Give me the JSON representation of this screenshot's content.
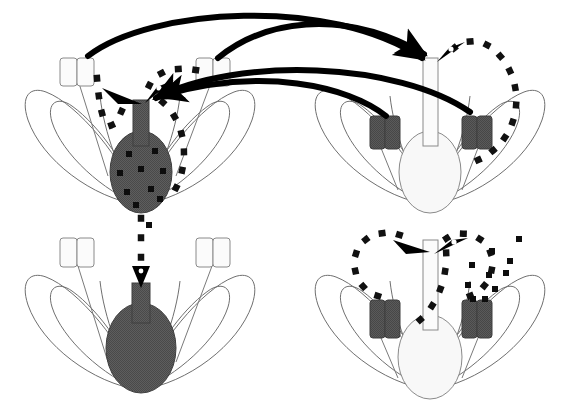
{
  "figure": {
    "width": 571,
    "height": 408,
    "background": "#ffffff",
    "panel_count": 4
  },
  "palette": {
    "outline": "#6b6b6b",
    "dark_fill": "#595959",
    "dark_fill_edge": "#3d3d3d",
    "light_fill": "#f7f7f7",
    "light_fill_edge": "#8a8a8a",
    "pollen_dot": "#111111",
    "arrow_solid": "#000000",
    "background": "#ffffff"
  },
  "legend_semantics": {
    "solid_thick_arrow": "cross-pollination pollen transfer between flowers",
    "dotted_arc_arrow": "self-pollination pollen transfer within a flower",
    "dark_organ": "dark (shaded) pistil or anther morph",
    "light_organ": "light (unshaded) pistil or anther morph"
  },
  "panels": [
    {
      "id": "top-left",
      "position": "top-left",
      "morph": "dark-pistil",
      "pistil": {
        "style_fill": "dark",
        "ovary_fill": "dark",
        "ovule_dots": 9
      },
      "anthers": [
        {
          "side": "left",
          "fill": "light"
        },
        {
          "side": "right",
          "fill": "light"
        }
      ],
      "petals": 2,
      "receives_cross_pollen": true,
      "self_pollination_arcs": 2
    },
    {
      "id": "top-right",
      "position": "top-right",
      "morph": "light-pistil",
      "pistil": {
        "style_fill": "light",
        "ovary_fill": "light",
        "ovule_dots": 0
      },
      "anthers": [
        {
          "side": "left",
          "fill": "dark"
        },
        {
          "side": "right",
          "fill": "dark"
        }
      ],
      "petals": 2,
      "receives_cross_pollen": true,
      "self_pollination_arcs": 1
    },
    {
      "id": "bottom-left",
      "position": "bottom-left",
      "morph": "dark-pistil",
      "pistil": {
        "style_fill": "dark",
        "ovary_fill": "dark",
        "ovule_dots": 0
      },
      "anthers": [
        {
          "side": "left",
          "fill": "light"
        },
        {
          "side": "right",
          "fill": "light"
        }
      ],
      "petals": 2,
      "receives_cross_pollen": false,
      "self_pollination_arcs": 0
    },
    {
      "id": "bottom-right",
      "position": "bottom-right",
      "morph": "light-pistil",
      "pistil": {
        "style_fill": "light",
        "ovary_fill": "light",
        "ovule_dots": 0
      },
      "anthers": [
        {
          "side": "left",
          "fill": "dark"
        },
        {
          "side": "right",
          "fill": "dark"
        }
      ],
      "petals": 2,
      "receives_cross_pollen": false,
      "self_pollination_arcs": 2
    }
  ],
  "cross_pollination_arrows": [
    {
      "id": "left-anther-to-right-stigma",
      "from_panel": "top-left",
      "from_organ": "left-anther",
      "to_panel": "top-right",
      "to_organ": "stigma"
    },
    {
      "id": "left-inner-anther-to-right-stigma",
      "from_panel": "top-left",
      "from_organ": "right-anther",
      "to_panel": "top-right",
      "to_organ": "stigma"
    },
    {
      "id": "right-anther-to-left-stigma",
      "from_panel": "top-right",
      "from_organ": "left-anther",
      "to_panel": "top-left",
      "to_organ": "stigma"
    },
    {
      "id": "right-outer-anther-to-left-stigma",
      "from_panel": "top-right",
      "from_organ": "right-anther",
      "to_panel": "top-left",
      "to_organ": "stigma"
    }
  ],
  "vertical_pollen_flow": {
    "id": "top-left-to-bottom-left",
    "style": "dotted",
    "from_panel": "top-left",
    "to_panel": "bottom-left",
    "to_organ": "stigma"
  }
}
